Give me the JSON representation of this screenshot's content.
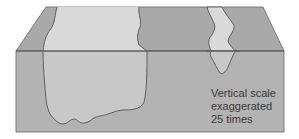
{
  "diagram": {
    "caption": {
      "line1": "Vertical scale",
      "line2": "exaggerated",
      "line3": "25 times"
    },
    "colors": {
      "block_top": "#a9a9a9",
      "block_front": "#b3b3b3",
      "plume_top": "#d9d9d9",
      "plume_front": "#c8c8c8",
      "outline": "#555555",
      "text": "#3a3a3a"
    }
  }
}
